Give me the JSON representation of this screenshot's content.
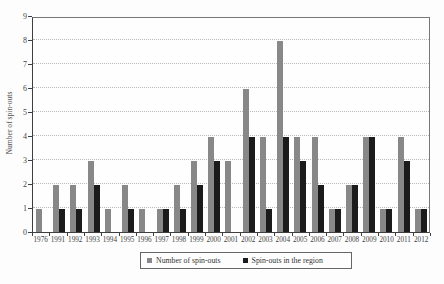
{
  "figure": {
    "background_color": "#fdfdfd",
    "axis_color": "#3f3f3f",
    "frame_color": "#777777",
    "gridline_color": "#b9b9b9",
    "gridline_style": "dotted"
  },
  "chart_data": {
    "type": "bar",
    "title": "",
    "xlabel": "",
    "ylabel": "Number of spin-outs",
    "ylim": [
      0,
      9
    ],
    "ytick_step": 1,
    "yticks": [
      0,
      1,
      2,
      3,
      4,
      5,
      6,
      7,
      8,
      9
    ],
    "grid": "horizontal dotted at each integer",
    "legend_position": "bottom-center boxed",
    "categories": [
      "1976",
      "1991",
      "1992",
      "1993",
      "1994",
      "1995",
      "1996",
      "1997",
      "1998",
      "1999",
      "2000",
      "2001",
      "2002",
      "2003",
      "2004",
      "2005",
      "2006",
      "2007",
      "2008",
      "2009",
      "2010",
      "2011",
      "2012"
    ],
    "series": [
      {
        "name": "Number of spin-outs",
        "color": "#888888",
        "values": [
          1,
          2,
          2,
          3,
          1,
          2,
          1,
          1,
          2,
          3,
          4,
          3,
          6,
          4,
          8,
          4,
          4,
          1,
          2,
          4,
          1,
          4,
          1
        ]
      },
      {
        "name": "Spin-outs in the region",
        "color": "#1b1b1b",
        "values": [
          0,
          1,
          1,
          2,
          0,
          1,
          0,
          1,
          1,
          2,
          3,
          0,
          4,
          1,
          4,
          3,
          2,
          1,
          2,
          4,
          1,
          3,
          1
        ]
      }
    ]
  }
}
